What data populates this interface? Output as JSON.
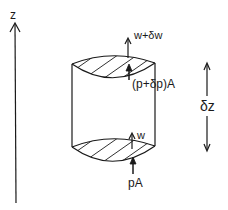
{
  "diagram": {
    "axis": {
      "label": "z"
    },
    "forces": {
      "top_weight": "w+δw",
      "top_pressure": "(p+δp)A",
      "bottom_weight": "w",
      "bottom_pressure": "pA"
    },
    "dimension": {
      "label": "δz"
    },
    "colors": {
      "stroke": "#1a1a1a",
      "background": "#ffffff"
    }
  }
}
